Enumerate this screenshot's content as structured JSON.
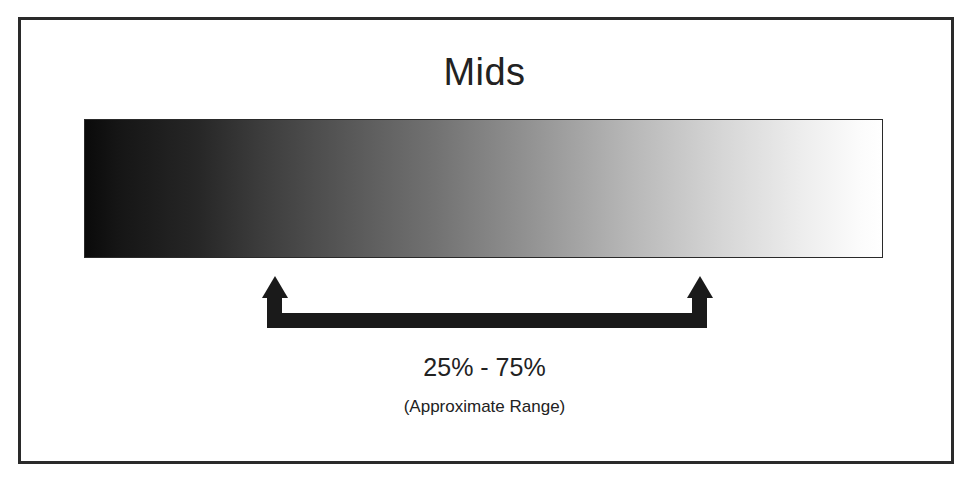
{
  "diagram": {
    "title": "Mids",
    "gradient": {
      "description": "Tonal range gradient from black (shadows) to white (highlights)",
      "start_color": "#0a0a0a",
      "end_color": "#ffffff"
    },
    "range": {
      "start_percent": 25,
      "end_percent": 75,
      "label": "25% - 75%",
      "sublabel": "(Approximate Range)"
    },
    "colors": {
      "frame": "#2a2a2a",
      "arrow": "#1a1a1a",
      "text": "#222222",
      "background": "#ffffff"
    }
  }
}
